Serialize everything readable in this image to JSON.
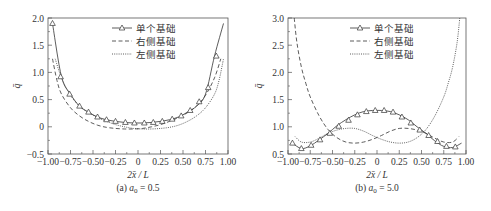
{
  "chart_data": [
    {
      "type": "line",
      "panel": "a",
      "caption": "(a) a₀ = 0.5",
      "caption_prefix": "(a) ",
      "caption_var": "a",
      "caption_sub": "0",
      "caption_value": " = 0.5",
      "xlabel": "2x̄ / L",
      "ylabel": "q̄",
      "xlim": [
        -1.0,
        1.0
      ],
      "ylim": [
        -0.5,
        2.0
      ],
      "xticks": [
        -1.0,
        -0.75,
        -0.5,
        -0.25,
        0,
        0.25,
        0.5,
        0.75,
        1.0
      ],
      "xtick_labels": [
        "−1.00",
        "−0.75",
        "−0.50",
        "−0.25",
        "0",
        "0.25",
        "0.50",
        "0.75",
        "1.00"
      ],
      "yticks": [
        -0.5,
        0,
        0.5,
        1.0,
        1.5,
        2.0
      ],
      "ytick_labels": [
        "−0.5",
        "0",
        "0.5",
        "1.0",
        "1.5",
        "2.0"
      ],
      "grid": false,
      "legend_position": "upper center",
      "series": [
        {
          "name": "单个基础",
          "style": "solid-triangle",
          "x": [
            -0.95,
            -0.85,
            -0.75,
            -0.65,
            -0.55,
            -0.45,
            -0.35,
            -0.25,
            -0.15,
            -0.05,
            0.05,
            0.15,
            0.25,
            0.35,
            0.45,
            0.55,
            0.65,
            0.75,
            0.85,
            0.95
          ],
          "values": [
            1.9,
            0.92,
            0.6,
            0.38,
            0.27,
            0.18,
            0.13,
            0.1,
            0.08,
            0.07,
            0.07,
            0.08,
            0.1,
            0.13,
            0.18,
            0.27,
            0.38,
            0.6,
            1.3,
            1.9
          ],
          "markers_x": [
            -0.95,
            -0.86,
            -0.76,
            -0.65,
            -0.55,
            -0.45,
            -0.35,
            -0.25,
            -0.14,
            -0.04,
            0.07,
            0.17,
            0.27,
            0.38,
            0.48,
            0.58,
            0.68,
            0.78,
            0.87
          ],
          "markers_y": [
            1.9,
            0.92,
            0.6,
            0.38,
            0.27,
            0.18,
            0.13,
            0.1,
            0.08,
            0.07,
            0.07,
            0.08,
            0.1,
            0.14,
            0.2,
            0.3,
            0.46,
            0.72,
            1.3
          ]
        },
        {
          "name": "右侧基础",
          "style": "dashed",
          "x": [
            -0.95,
            -0.9,
            -0.85,
            -0.75,
            -0.65,
            -0.55,
            -0.45,
            -0.35,
            -0.25,
            -0.15,
            -0.05,
            0.05,
            0.15,
            0.25,
            0.35,
            0.45,
            0.55,
            0.65,
            0.75,
            0.85,
            0.92
          ],
          "values": [
            1.25,
            0.85,
            0.6,
            0.35,
            0.2,
            0.1,
            0.03,
            -0.01,
            -0.03,
            -0.04,
            -0.04,
            -0.03,
            0.0,
            0.04,
            0.1,
            0.17,
            0.26,
            0.38,
            0.58,
            0.9,
            1.25
          ]
        },
        {
          "name": "左侧基础",
          "style": "dotted",
          "x": [
            -0.92,
            -0.85,
            -0.75,
            -0.65,
            -0.55,
            -0.45,
            -0.35,
            -0.25,
            -0.15,
            -0.05,
            0.05,
            0.15,
            0.25,
            0.35,
            0.45,
            0.55,
            0.65,
            0.75,
            0.85,
            0.9,
            0.95
          ],
          "values": [
            1.25,
            0.9,
            0.58,
            0.38,
            0.26,
            0.17,
            0.1,
            0.04,
            0.0,
            -0.03,
            -0.04,
            -0.04,
            -0.03,
            -0.01,
            0.03,
            0.1,
            0.2,
            0.35,
            0.6,
            0.85,
            1.25
          ]
        }
      ]
    },
    {
      "type": "line",
      "panel": "b",
      "caption": "(b) a₀ = 5.0",
      "caption_prefix": "(b) ",
      "caption_var": "a",
      "caption_sub": "0",
      "caption_value": " = 5.0",
      "xlabel": "2x̄ / L",
      "ylabel": "q̄",
      "xlim": [
        -1.0,
        1.0
      ],
      "ylim": [
        0.5,
        3.0
      ],
      "xticks": [
        -1.0,
        -0.75,
        -0.5,
        -0.25,
        0,
        0.25,
        0.5,
        0.75,
        1.0
      ],
      "xtick_labels": [
        "−1.00",
        "−0.75",
        "−0.50",
        "−0.25",
        "0",
        "0.25",
        "0.50",
        "0.75",
        "1.00"
      ],
      "yticks": [
        0.5,
        1.0,
        1.5,
        2.0,
        2.5,
        3.0
      ],
      "ytick_labels": [
        "0.5",
        "1.0",
        "1.5",
        "2.0",
        "2.5",
        "3.0"
      ],
      "grid": false,
      "legend_position": "upper center",
      "series": [
        {
          "name": "单个基础",
          "style": "solid-triangle",
          "x": [
            -0.95,
            -0.85,
            -0.75,
            -0.65,
            -0.55,
            -0.45,
            -0.35,
            -0.25,
            -0.15,
            -0.05,
            0.05,
            0.15,
            0.25,
            0.35,
            0.45,
            0.55,
            0.65,
            0.75,
            0.85,
            0.95
          ],
          "values": [
            0.7,
            0.6,
            0.65,
            0.76,
            0.88,
            1.02,
            1.13,
            1.22,
            1.28,
            1.3,
            1.3,
            1.28,
            1.22,
            1.13,
            1.0,
            0.88,
            0.74,
            0.64,
            0.62,
            0.7
          ],
          "markers_x": [
            -0.95,
            -0.85,
            -0.74,
            -0.64,
            -0.53,
            -0.43,
            -0.32,
            -0.22,
            -0.12,
            -0.02,
            0.08,
            0.18,
            0.28,
            0.38,
            0.48,
            0.58,
            0.68,
            0.78,
            0.88
          ],
          "markers_y": [
            0.7,
            0.6,
            0.66,
            0.76,
            0.88,
            1.01,
            1.12,
            1.22,
            1.28,
            1.3,
            1.3,
            1.27,
            1.18,
            1.07,
            0.94,
            0.84,
            0.73,
            0.64,
            0.63
          ]
        },
        {
          "name": "右侧基础",
          "style": "dashed",
          "x": [
            -0.93,
            -0.9,
            -0.85,
            -0.8,
            -0.75,
            -0.65,
            -0.55,
            -0.45,
            -0.35,
            -0.25,
            -0.15,
            -0.05,
            0.05,
            0.15,
            0.25,
            0.35,
            0.45,
            0.55,
            0.65,
            0.75,
            0.85,
            0.92
          ],
          "values": [
            3.0,
            2.55,
            2.1,
            1.8,
            1.55,
            1.2,
            0.95,
            0.8,
            0.72,
            0.7,
            0.72,
            0.77,
            0.84,
            0.92,
            0.97,
            0.97,
            0.94,
            0.88,
            0.79,
            0.72,
            0.72,
            0.82
          ]
        },
        {
          "name": "左侧基础",
          "style": "dotted",
          "x": [
            -0.92,
            -0.85,
            -0.75,
            -0.65,
            -0.55,
            -0.45,
            -0.35,
            -0.25,
            -0.15,
            -0.05,
            0.05,
            0.15,
            0.25,
            0.35,
            0.45,
            0.55,
            0.65,
            0.75,
            0.8,
            0.85,
            0.9,
            0.93
          ],
          "values": [
            0.82,
            0.72,
            0.72,
            0.79,
            0.88,
            0.94,
            0.97,
            0.97,
            0.92,
            0.84,
            0.77,
            0.72,
            0.7,
            0.72,
            0.8,
            0.95,
            1.2,
            1.55,
            1.8,
            2.1,
            2.55,
            3.0
          ]
        }
      ]
    }
  ],
  "legend": {
    "items": [
      {
        "label": "单个基础",
        "style": "solid-triangle"
      },
      {
        "label": "右侧基础",
        "style": "dashed"
      },
      {
        "label": "左侧基础",
        "style": "dotted"
      }
    ]
  },
  "colors": {
    "line": "#333333",
    "frame": "#555555",
    "text": "#333333"
  }
}
